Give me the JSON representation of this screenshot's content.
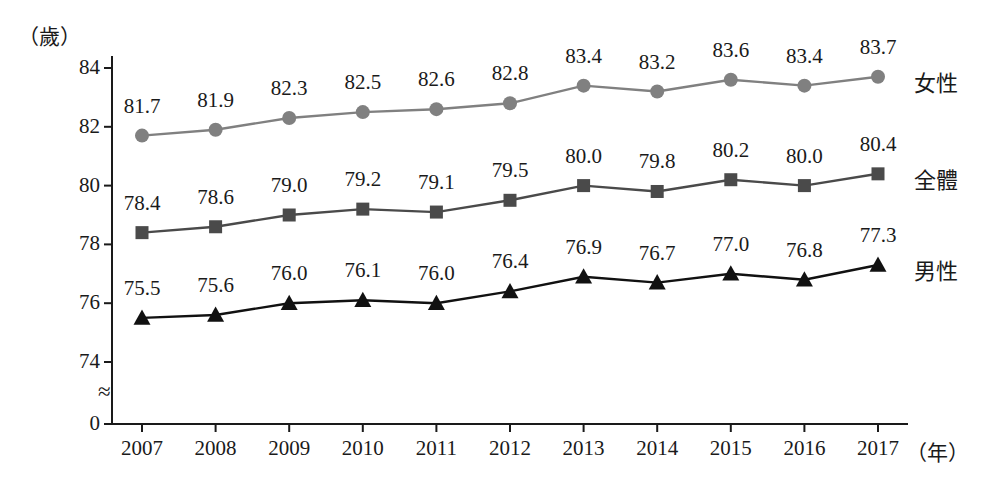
{
  "chart_data": {
    "type": "line",
    "title": "",
    "xlabel": "年",
    "ylabel": "（歲）",
    "categories": [
      "2007",
      "2008",
      "2009",
      "2010",
      "2011",
      "2012",
      "2013",
      "2014",
      "2015",
      "2016",
      "2017"
    ],
    "ylim": [
      73.2,
      84.6
    ],
    "yticks": [
      "0",
      "74",
      "76",
      "78",
      "80",
      "82",
      "84"
    ],
    "axis_break": true,
    "grid": false,
    "legend_position": "right-inline",
    "series": [
      {
        "name": "女性",
        "marker": "circle",
        "color": "#808080",
        "values": [
          81.7,
          81.9,
          82.3,
          82.5,
          82.6,
          82.8,
          83.4,
          83.2,
          83.6,
          83.4,
          83.7
        ],
        "labels": [
          "81.7",
          "81.9",
          "82.3",
          "82.5",
          "82.6",
          "82.8",
          "83.4",
          "83.2",
          "83.6",
          "83.4",
          "83.7"
        ]
      },
      {
        "name": "全體",
        "marker": "square",
        "color": "#4a4a4a",
        "values": [
          78.4,
          78.6,
          79.0,
          79.2,
          79.1,
          79.5,
          80.0,
          79.8,
          80.2,
          80.0,
          80.4
        ],
        "labels": [
          "78.4",
          "78.6",
          "79.0",
          "79.2",
          "79.1",
          "79.5",
          "80.0",
          "79.8",
          "80.2",
          "80.0",
          "80.4"
        ]
      },
      {
        "name": "男性",
        "marker": "triangle",
        "color": "#111111",
        "values": [
          75.5,
          75.6,
          76.0,
          76.1,
          76.0,
          76.4,
          76.9,
          76.7,
          77.0,
          76.8,
          77.3
        ],
        "labels": [
          "75.5",
          "75.6",
          "76.0",
          "76.1",
          "76.0",
          "76.4",
          "76.9",
          "76.7",
          "77.0",
          "76.8",
          "77.3"
        ]
      }
    ]
  },
  "axis": {
    "unit_y": "（歲）",
    "unit_x": "（年）"
  }
}
